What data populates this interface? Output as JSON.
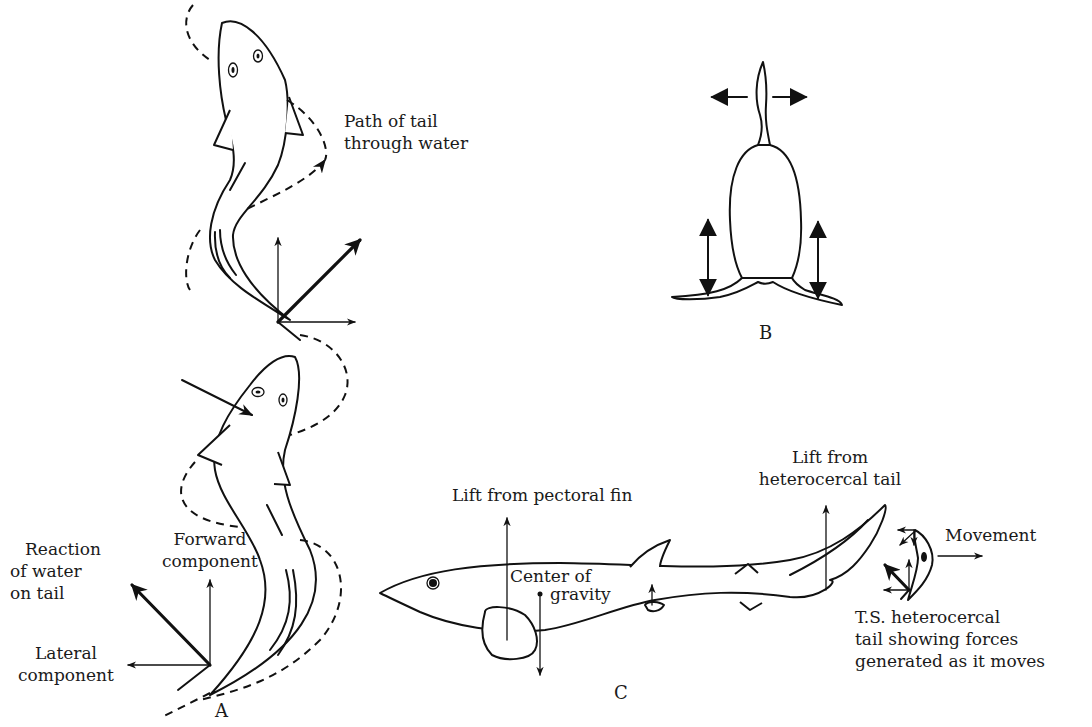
{
  "figure": {
    "panels": {
      "A": {
        "label": "A",
        "annotations": {
          "path_line1": "Path of tail",
          "path_line2": "through water",
          "reaction_line1": "Reaction",
          "reaction_line2": "of water",
          "reaction_line3": "on tail",
          "forward_line1": "Forward",
          "forward_line2": "component",
          "lateral_line1": "Lateral",
          "lateral_line2": "component"
        }
      },
      "B": {
        "label": "B"
      },
      "C": {
        "label": "C",
        "annotations": {
          "pectoral_lift": "Lift from pectoral fin",
          "tail_lift_line1": "Lift from",
          "tail_lift_line2": "heterocercal tail",
          "cog_line1": "Center of",
          "cog_line2": "gravity",
          "movement": "Movement",
          "ts_line1": "T.S. heterocercal",
          "ts_line2": "tail showing forces",
          "ts_line3": "generated as it moves"
        }
      }
    },
    "colors": {
      "ink": "#111111",
      "background": "#ffffff"
    }
  }
}
